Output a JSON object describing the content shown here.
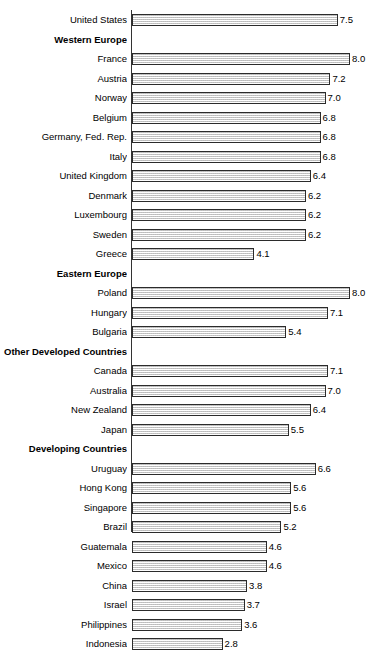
{
  "chart_data": {
    "type": "bar",
    "orientation": "horizontal",
    "title": "",
    "subtitle": "",
    "xlabel": "",
    "ylabel": "",
    "xlim": [
      0,
      8.0
    ],
    "grid": false,
    "legend": null,
    "value_format": "one-decimal",
    "categories": [
      "United States",
      "Western Europe",
      "France",
      "Austria",
      "Norway",
      "Belgium",
      "Germany,  Fed. Rep.",
      "Italy",
      "United Kingdom",
      "Denmark",
      "Luxembourg",
      "Sweden",
      "Greece",
      "Eastern Europe",
      "Poland",
      "Hungary",
      "Bulgaria",
      "Other Developed Countries",
      "Canada",
      "Australia",
      "New Zealand",
      "Japan",
      "Developing Countries",
      "Uruguay",
      "Hong Kong",
      "Singapore",
      "Brazil",
      "Guatemala",
      "Mexico",
      "China",
      "Israel",
      "Philippines",
      "Indonesia"
    ],
    "values": [
      7.5,
      null,
      8.0,
      7.2,
      7.0,
      6.8,
      6.8,
      6.8,
      6.4,
      6.2,
      6.2,
      6.2,
      4.1,
      null,
      8.0,
      7.1,
      5.4,
      null,
      7.1,
      7.0,
      6.4,
      5.5,
      null,
      6.6,
      5.6,
      5.6,
      5.2,
      4.6,
      4.6,
      3.8,
      3.7,
      3.6,
      2.8
    ],
    "value_labels": [
      "7.5",
      "",
      "8.0",
      "7.2",
      "7.0",
      "6.8",
      "6.8",
      "6.8",
      "6.4",
      "6.2",
      "6.2",
      "6.2",
      "4.1",
      "",
      "8.0",
      "7.1",
      "5.4",
      "",
      "7.1",
      "7.0",
      "6.4",
      "5.5",
      "",
      "6.6",
      "5.6",
      "5.6",
      "5.2",
      "4.6",
      "4.6",
      "3.8",
      "3.7",
      "3.6",
      "2.8"
    ],
    "group_headers": [
      "Western Europe",
      "Eastern Europe",
      "Other Developed Countries",
      "Developing Countries"
    ],
    "colors": {
      "bar_fill": "#e8e8e8",
      "bar_border": "#2b2b2b",
      "axis": "#333333",
      "text": "#000000",
      "background": "#ffffff"
    }
  },
  "rows": [
    {
      "label": "United States",
      "value": 7.5,
      "value_label": "7.5",
      "group": false
    },
    {
      "label": "Western Europe",
      "value": null,
      "value_label": "",
      "group": true
    },
    {
      "label": "France",
      "value": 8.0,
      "value_label": "8.0",
      "group": false
    },
    {
      "label": "Austria",
      "value": 7.2,
      "value_label": "7.2",
      "group": false
    },
    {
      "label": "Norway",
      "value": 7.0,
      "value_label": "7.0",
      "group": false
    },
    {
      "label": "Belgium",
      "value": 6.8,
      "value_label": "6.8",
      "group": false
    },
    {
      "label": "Germany,  Fed. Rep.",
      "value": 6.8,
      "value_label": "6.8",
      "group": false
    },
    {
      "label": "Italy",
      "value": 6.8,
      "value_label": "6.8",
      "group": false
    },
    {
      "label": "United Kingdom",
      "value": 6.4,
      "value_label": "6.4",
      "group": false
    },
    {
      "label": "Denmark",
      "value": 6.2,
      "value_label": "6.2",
      "group": false
    },
    {
      "label": "Luxembourg",
      "value": 6.2,
      "value_label": "6.2",
      "group": false
    },
    {
      "label": "Sweden",
      "value": 6.2,
      "value_label": "6.2",
      "group": false
    },
    {
      "label": "Greece",
      "value": 4.1,
      "value_label": "4.1",
      "group": false
    },
    {
      "label": "Eastern Europe",
      "value": null,
      "value_label": "",
      "group": true
    },
    {
      "label": "Poland",
      "value": 8.0,
      "value_label": "8.0",
      "group": false
    },
    {
      "label": "Hungary",
      "value": 7.1,
      "value_label": "7.1",
      "group": false
    },
    {
      "label": "Bulgaria",
      "value": 5.4,
      "value_label": "5.4",
      "group": false
    },
    {
      "label": "Other Developed Countries",
      "value": null,
      "value_label": "",
      "group": true
    },
    {
      "label": "Canada",
      "value": 7.1,
      "value_label": "7.1",
      "group": false
    },
    {
      "label": "Australia",
      "value": 7.0,
      "value_label": "7.0",
      "group": false
    },
    {
      "label": "New Zealand",
      "value": 6.4,
      "value_label": "6.4",
      "group": false
    },
    {
      "label": "Japan",
      "value": 5.5,
      "value_label": "5.5",
      "group": false
    },
    {
      "label": "Developing Countries",
      "value": null,
      "value_label": "",
      "group": true
    },
    {
      "label": "Uruguay",
      "value": 6.6,
      "value_label": "6.6",
      "group": false
    },
    {
      "label": "Hong Kong",
      "value": 5.6,
      "value_label": "5.6",
      "group": false
    },
    {
      "label": "Singapore",
      "value": 5.6,
      "value_label": "5.6",
      "group": false
    },
    {
      "label": "Brazil",
      "value": 5.2,
      "value_label": "5.2",
      "group": false
    },
    {
      "label": "Guatemala",
      "value": 4.6,
      "value_label": "4.6",
      "group": false
    },
    {
      "label": "Mexico",
      "value": 4.6,
      "value_label": "4.6",
      "group": false
    },
    {
      "label": "China",
      "value": 3.8,
      "value_label": "3.8",
      "group": false
    },
    {
      "label": "Israel",
      "value": 3.7,
      "value_label": "3.7",
      "group": false
    },
    {
      "label": "Philippines",
      "value": 3.6,
      "value_label": "3.6",
      "group": false
    },
    {
      "label": "Indonesia",
      "value": 2.8,
      "value_label": "2.8",
      "group": false
    }
  ],
  "geometry": {
    "row_height": 19.5,
    "first_row_top": 10,
    "axis_x": 131,
    "px_per_unit": 24.5,
    "zero_offset": 22
  }
}
